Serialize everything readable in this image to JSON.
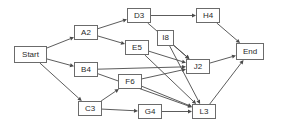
{
  "diagram": {
    "type": "directed-graph",
    "canvas": {
      "width": 285,
      "height": 130
    },
    "style": {
      "background": "#ffffff",
      "node_border": "#6b6b6b",
      "node_fill": "#ffffff",
      "node_text": "#2a2a2a",
      "edge_color": "#4a4a4a"
    },
    "nodes": [
      {
        "id": "start",
        "label": "Start",
        "x": 14,
        "y": 46,
        "w": 33,
        "h": 17
      },
      {
        "id": "a2",
        "label": "A2",
        "x": 74,
        "y": 25,
        "w": 24,
        "h": 15
      },
      {
        "id": "b4",
        "label": "B4",
        "x": 74,
        "y": 62,
        "w": 24,
        "h": 15
      },
      {
        "id": "c3",
        "label": "C3",
        "x": 78,
        "y": 101,
        "w": 24,
        "h": 15
      },
      {
        "id": "d3",
        "label": "D3",
        "x": 127,
        "y": 8,
        "w": 24,
        "h": 15
      },
      {
        "id": "e5",
        "label": "E5",
        "x": 125,
        "y": 40,
        "w": 24,
        "h": 15
      },
      {
        "id": "f6",
        "label": "F6",
        "x": 118,
        "y": 74,
        "w": 24,
        "h": 15
      },
      {
        "id": "g4",
        "label": "G4",
        "x": 138,
        "y": 104,
        "w": 24,
        "h": 15
      },
      {
        "id": "i8",
        "label": "I8",
        "x": 157,
        "y": 30,
        "w": 17,
        "h": 16
      },
      {
        "id": "h4",
        "label": "H4",
        "x": 196,
        "y": 8,
        "w": 24,
        "h": 15
      },
      {
        "id": "j2",
        "label": "J2",
        "x": 186,
        "y": 59,
        "w": 24,
        "h": 15
      },
      {
        "id": "l3",
        "label": "L3",
        "x": 192,
        "y": 104,
        "w": 24,
        "h": 15
      },
      {
        "id": "end",
        "label": "End",
        "x": 236,
        "y": 43,
        "w": 28,
        "h": 17
      }
    ],
    "edges": [
      {
        "from": "start",
        "to": "a2"
      },
      {
        "from": "start",
        "to": "b4"
      },
      {
        "from": "start",
        "to": "c3"
      },
      {
        "from": "a2",
        "to": "d3"
      },
      {
        "from": "a2",
        "to": "e5"
      },
      {
        "from": "d3",
        "to": "h4"
      },
      {
        "from": "d3",
        "to": "j2"
      },
      {
        "from": "b4",
        "to": "j2"
      },
      {
        "from": "b4",
        "to": "l3"
      },
      {
        "from": "c3",
        "to": "f6"
      },
      {
        "from": "c3",
        "to": "g4"
      },
      {
        "from": "e5",
        "to": "j2"
      },
      {
        "from": "e5",
        "to": "l3"
      },
      {
        "from": "f6",
        "to": "j2"
      },
      {
        "from": "f6",
        "to": "l3"
      },
      {
        "from": "i8",
        "to": "j2"
      },
      {
        "from": "i8",
        "to": "l3"
      },
      {
        "from": "g4",
        "to": "l3"
      },
      {
        "from": "h4",
        "to": "end"
      },
      {
        "from": "j2",
        "to": "end"
      },
      {
        "from": "l3",
        "to": "end"
      }
    ]
  }
}
